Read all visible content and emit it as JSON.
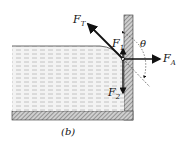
{
  "figure": {
    "caption": "(b)",
    "labels": {
      "tension": {
        "main": "F",
        "sub": "T"
      },
      "f1": {
        "main": "F",
        "sub": "1"
      },
      "f2": {
        "main": "F",
        "sub": "2"
      },
      "fa": {
        "main": "F",
        "sub": "A"
      },
      "theta": "θ"
    },
    "colors": {
      "liquid_fill": "#f1f1f1",
      "liquid_lines": "#b8b8b8",
      "wall_fill": "#9a9a9a",
      "arrow": "#111111"
    }
  }
}
